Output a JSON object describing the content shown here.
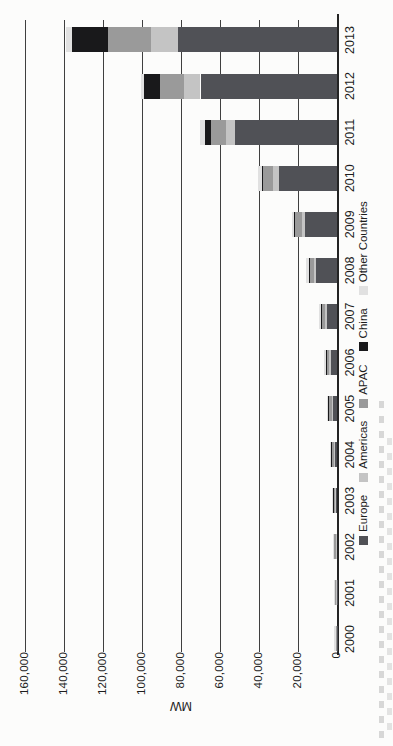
{
  "page": {
    "kind": "scanned figure page",
    "note": "landscape chart printed rotated 90deg counter-clockwise on a portrait page"
  },
  "chart_data": {
    "type": "bar",
    "stacked": true,
    "ylabel": "MW",
    "categories": [
      "2000",
      "2001",
      "2002",
      "2003",
      "2004",
      "2005",
      "2006",
      "2007",
      "2008",
      "2009",
      "2010",
      "2011",
      "2012",
      "2013"
    ],
    "series": [
      {
        "name": "Europe",
        "color": "#505156",
        "values": [
          150,
          250,
          400,
          600,
          1300,
          2300,
          3300,
          5300,
          10600,
          16400,
          29700,
          52300,
          70000,
          81500
        ]
      },
      {
        "name": "Americas",
        "color": "#c4c4c4",
        "values": [
          150,
          180,
          220,
          290,
          380,
          500,
          650,
          860,
          1200,
          1800,
          3100,
          4600,
          8700,
          13700
        ]
      },
      {
        "name": "APAC",
        "color": "#9a9a9a",
        "values": [
          350,
          500,
          690,
          920,
          1200,
          1500,
          1800,
          2100,
          2600,
          3400,
          5000,
          7600,
          12200,
          22000
        ]
      },
      {
        "name": "China",
        "color": "#19191b",
        "values": [
          20,
          25,
          40,
          50,
          60,
          70,
          80,
          100,
          150,
          300,
          800,
          3300,
          8300,
          18600
        ]
      },
      {
        "name": "Other Countries",
        "color": "#e1e1e1",
        "values": [
          630,
          645,
          750,
          740,
          760,
          730,
          870,
          840,
          1250,
          1300,
          1700,
          2700,
          1300,
          3100
        ]
      }
    ],
    "ylim": [
      0,
      160000
    ],
    "ytick_step": 20000,
    "ytick_labels": [
      "0",
      "20,000",
      "40,000",
      "60,000",
      "80,000",
      "100,000",
      "120,000",
      "140,000",
      "160,000"
    ],
    "grid": true,
    "legend_position": "bottom",
    "axis_orientation": "columns by year, value axis vertical (appears rotated on page)"
  }
}
